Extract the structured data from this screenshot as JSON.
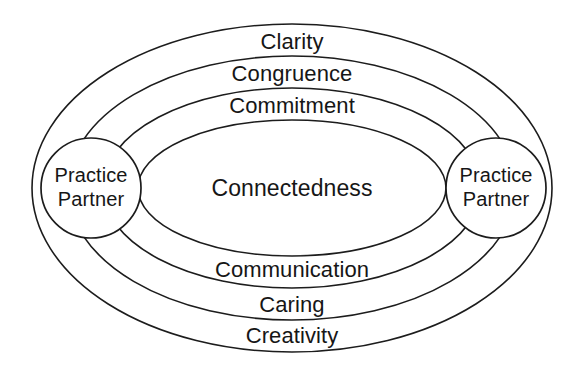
{
  "diagram": {
    "type": "concentric-ellipse-venn",
    "background_color": "#ffffff",
    "stroke_color": "#1c1c1c",
    "text_color": "#161616",
    "core": {
      "label": "Connectedness"
    },
    "nodes": [
      {
        "id": "left-node",
        "line1": "Practice",
        "line2": "Partner"
      },
      {
        "id": "right-node",
        "line1": "Practice",
        "line2": "Partner"
      }
    ],
    "rings": [
      {
        "id": "ring-outer",
        "top_label": "Clarity",
        "bottom_label": "Creativity",
        "rx": 260,
        "ry": 164
      },
      {
        "id": "ring-second",
        "top_label": "Congruence",
        "bottom_label": "Caring",
        "rx": 224,
        "ry": 132
      },
      {
        "id": "ring-third",
        "top_label": "Commitment",
        "bottom_label": "Communication",
        "rx": 189,
        "ry": 100
      },
      {
        "id": "ring-inner",
        "top_label": "",
        "bottom_label": "",
        "rx": 154,
        "ry": 68
      }
    ],
    "top_labels": [
      "Clarity",
      "Congruence",
      "Commitment"
    ],
    "bottom_labels": [
      "Communication",
      "Caring",
      "Creativity"
    ]
  }
}
